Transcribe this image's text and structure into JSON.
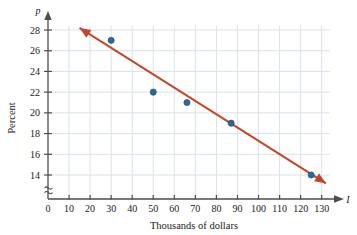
{
  "chart_data": {
    "type": "scatter",
    "title": "",
    "xlabel": "Thousands of dollars",
    "ylabel": "Percent",
    "x_axis_variable": "I",
    "y_axis_variable": "p",
    "xlim": [
      0,
      133
    ],
    "ylim": [
      13,
      28.6
    ],
    "x_ticks": [
      0,
      10,
      20,
      30,
      40,
      50,
      60,
      70,
      80,
      90,
      100,
      110,
      120,
      130
    ],
    "y_ticks": [
      14,
      16,
      18,
      20,
      22,
      24,
      26,
      28
    ],
    "y_axis_break": true,
    "y_axis_break_symbol": "≈",
    "grid": true,
    "legend": "none",
    "points": [
      {
        "x": 30,
        "y": 27.0
      },
      {
        "x": 50,
        "y": 22.0
      },
      {
        "x": 66,
        "y": 21.0
      },
      {
        "x": 87,
        "y": 19.0
      },
      {
        "x": 125,
        "y": 14.0
      }
    ],
    "trend_line": {
      "label": "line of best fit",
      "x_start": 15,
      "y_start": 28.2,
      "x_end": 132,
      "y_end": 13.2,
      "double_arrow": true
    },
    "colors": {
      "point": "#2b6a96",
      "trend_line": "#c4452a",
      "axis": "#4d4d4d",
      "grid": "#d9e2ea",
      "text": "#1a1a1a"
    }
  }
}
